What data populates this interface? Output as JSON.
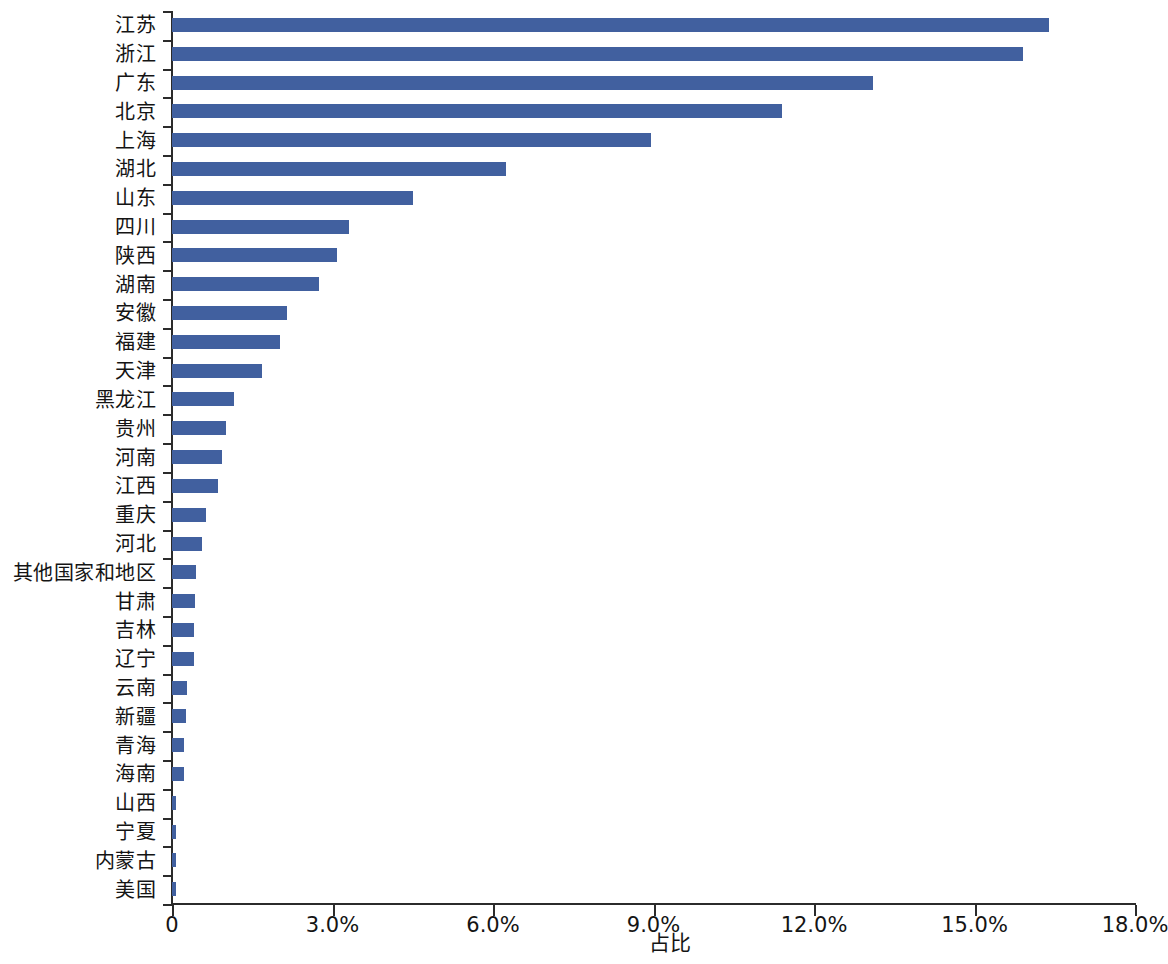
{
  "chart_data": {
    "type": "bar",
    "orientation": "horizontal",
    "title": "",
    "xlabel": "占比",
    "ylabel": "",
    "xlim": [
      0,
      18
    ],
    "xtick_labels": [
      "0",
      "3.0%",
      "6.0%",
      "9.0%",
      "12.0%",
      "15.0%",
      "18.0%"
    ],
    "xtick_values": [
      0,
      3,
      6,
      9,
      12,
      15,
      18
    ],
    "grid": false,
    "legend": null,
    "series_color": "#41609f",
    "unit": "%",
    "categories": [
      "江苏",
      "浙江",
      "广东",
      "北京",
      "上海",
      "湖北",
      "山东",
      "四川",
      "陕西",
      "湖南",
      "安徽",
      "福建",
      "天津",
      "黑龙江",
      "贵州",
      "河南",
      "江西",
      "重庆",
      "河北",
      "其他国家和地区",
      "甘肃",
      "吉林",
      "辽宁",
      "云南",
      "新疆",
      "青海",
      "海南",
      "山西",
      "宁夏",
      "内蒙古",
      "美国"
    ],
    "values": [
      16.4,
      15.9,
      13.1,
      11.4,
      8.95,
      6.25,
      4.5,
      3.3,
      3.08,
      2.75,
      2.15,
      2.02,
      1.68,
      1.15,
      1.0,
      0.93,
      0.86,
      0.63,
      0.57,
      0.44,
      0.43,
      0.42,
      0.42,
      0.28,
      0.27,
      0.22,
      0.23,
      0.07,
      0.08,
      0.08,
      0.07
    ]
  }
}
